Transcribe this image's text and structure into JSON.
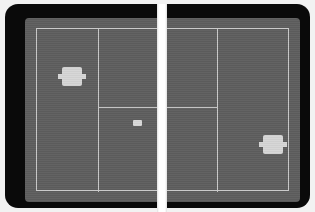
{
  "app": {
    "title": "Tennis",
    "genre": "sports-game",
    "view": "top-down-court"
  },
  "colors": {
    "page_background": "#f2f2f2",
    "bezel": "#0a0a0a",
    "court_surface": "#5e5e5e",
    "court_line": "#c9c9c9",
    "net": "#fbfbfb",
    "sprite": "#d6d6d6",
    "ball": "#d9d9d9"
  },
  "court": {
    "label": "tennis-court",
    "surface_color": "#5e5e5e",
    "boundary_label": "court-boundary",
    "lines": [
      {
        "name": "left-service-sideline",
        "orientation": "vertical",
        "side": "left"
      },
      {
        "name": "left-service-line",
        "orientation": "horizontal",
        "side": "left"
      },
      {
        "name": "right-service-sideline",
        "orientation": "vertical",
        "side": "right"
      },
      {
        "name": "right-service-line",
        "orientation": "horizontal",
        "side": "right"
      }
    ]
  },
  "net": {
    "label": "net",
    "orientation": "vertical",
    "position": "center",
    "color": "#fbfbfb"
  },
  "sprites": {
    "player_left": {
      "label": "player-one",
      "side": "left",
      "color": "#d6d6d6",
      "position": {
        "x": 33,
        "y": 49
      }
    },
    "player_right": {
      "label": "player-two",
      "side": "right",
      "color": "#d6d6d6",
      "position": {
        "x": 234,
        "y": 117
      }
    },
    "ball": {
      "label": "ball",
      "color": "#d9d9d9",
      "position": {
        "x": 128,
        "y": 116
      }
    }
  }
}
